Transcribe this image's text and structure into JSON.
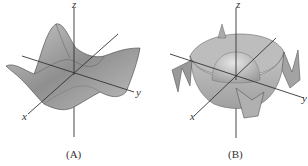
{
  "figures": [
    {
      "id": "A",
      "caption": "(A)",
      "axes": {
        "x": "x",
        "y": "y",
        "z": "z"
      },
      "surface_color": "#9a9a9a"
    },
    {
      "id": "B",
      "caption": "(B)",
      "axes": {
        "x": "x",
        "y": "y",
        "z": "z"
      },
      "surface_color": "#a8a8a8"
    }
  ]
}
